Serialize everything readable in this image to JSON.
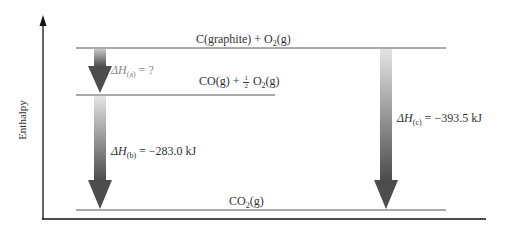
{
  "diagram": {
    "type": "enthalpy-level-diagram",
    "y_axis_label": "Enthalpy",
    "levels": [
      {
        "id": "top",
        "species": "C(graphite) + O",
        "sub": "2",
        "tail": "(g)"
      },
      {
        "id": "middle",
        "species_a": "CO(g) + ",
        "frac_num": "1",
        "frac_den": "2",
        "species_b": " O",
        "sub": "2",
        "tail": "(g)"
      },
      {
        "id": "bottom",
        "species": "CO",
        "sub": "2",
        "tail": "(g)"
      }
    ],
    "arrows": [
      {
        "id": "a",
        "delta": "ΔH",
        "sub": "(a)",
        "value": " = ?"
      },
      {
        "id": "b",
        "delta": "ΔH",
        "sub": "(b)",
        "value": " = −283.0 kJ"
      },
      {
        "id": "c",
        "delta": "ΔH",
        "sub": "(c)",
        "value": " = −393.5 kJ"
      }
    ],
    "colors": {
      "arrow_dark": "#555555",
      "arrow_light": "#d8d8d8",
      "line": "#555555",
      "axis": "#111111"
    }
  }
}
